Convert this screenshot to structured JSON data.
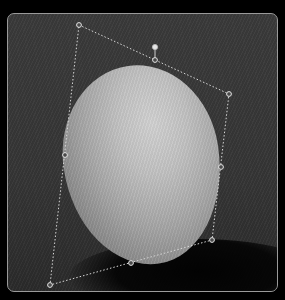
{
  "canvas": {
    "subject": "egg photo",
    "frame_border_color": "#9a9a9a",
    "background_color": "#363636"
  },
  "transform_box": {
    "mode": "perspective/distort transform",
    "line_color": "#d8d8d8",
    "handles": [
      {
        "name": "top-left-corner-handle",
        "x": 79,
        "y": 25
      },
      {
        "name": "top-middle-handle",
        "x": 155,
        "y": 60
      },
      {
        "name": "top-right-corner-handle",
        "x": 229,
        "y": 94
      },
      {
        "name": "right-middle-handle",
        "x": 221,
        "y": 167
      },
      {
        "name": "bottom-right-corner-handle",
        "x": 212,
        "y": 240
      },
      {
        "name": "bottom-middle-handle",
        "x": 131,
        "y": 263
      },
      {
        "name": "bottom-left-corner-handle",
        "x": 50,
        "y": 285
      },
      {
        "name": "left-middle-handle",
        "x": 65,
        "y": 155
      }
    ],
    "rotate_handle": {
      "x": 155,
      "y": 47
    }
  }
}
